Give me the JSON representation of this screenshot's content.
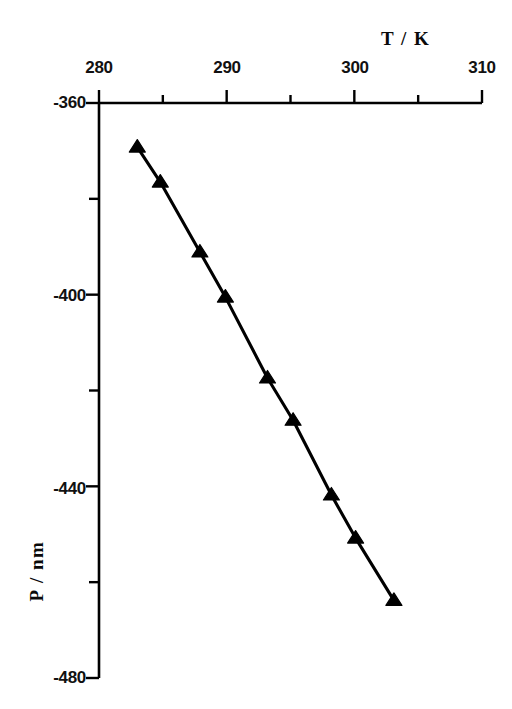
{
  "chart_data": {
    "type": "scatter",
    "title": "",
    "subtitle": "",
    "xlabel": "T / K",
    "ylabel": "P / nm",
    "xlim": [
      280,
      310
    ],
    "ylim": [
      -480,
      -360
    ],
    "x_major_ticks": [
      280,
      290,
      300,
      310
    ],
    "x_minor_ticks": [
      285,
      295,
      305
    ],
    "y_major_ticks": [
      -360,
      -400,
      -440,
      -480
    ],
    "y_minor_ticks": [
      -380,
      -420,
      -460
    ],
    "x_tick_labels": [
      "280",
      "290",
      "300",
      "310"
    ],
    "y_tick_labels": [
      "-360",
      "-400",
      "-440",
      "-480"
    ],
    "grid": false,
    "legend": null,
    "marker": "filled-triangle-up",
    "line_style": "solid",
    "series": [
      {
        "name": "P vs T",
        "x": [
          283.0,
          284.8,
          287.9,
          289.9,
          293.2,
          295.2,
          298.2,
          300.1,
          303.1
        ],
        "y": [
          -369.2,
          -376.5,
          -391.1,
          -400.5,
          -417.4,
          -426.2,
          -441.8,
          -450.8,
          -463.8
        ]
      }
    ],
    "annotations": []
  },
  "axes": {
    "x_title": "T / K",
    "y_title": "P / nm"
  },
  "ticks": {
    "x": [
      "280",
      "290",
      "300",
      "310"
    ],
    "y": [
      "-360",
      "-400",
      "-440",
      "-480"
    ]
  },
  "style": {
    "ink": "#000000",
    "background": "#ffffff",
    "marker_color": "#000000",
    "line_color": "#000000"
  }
}
